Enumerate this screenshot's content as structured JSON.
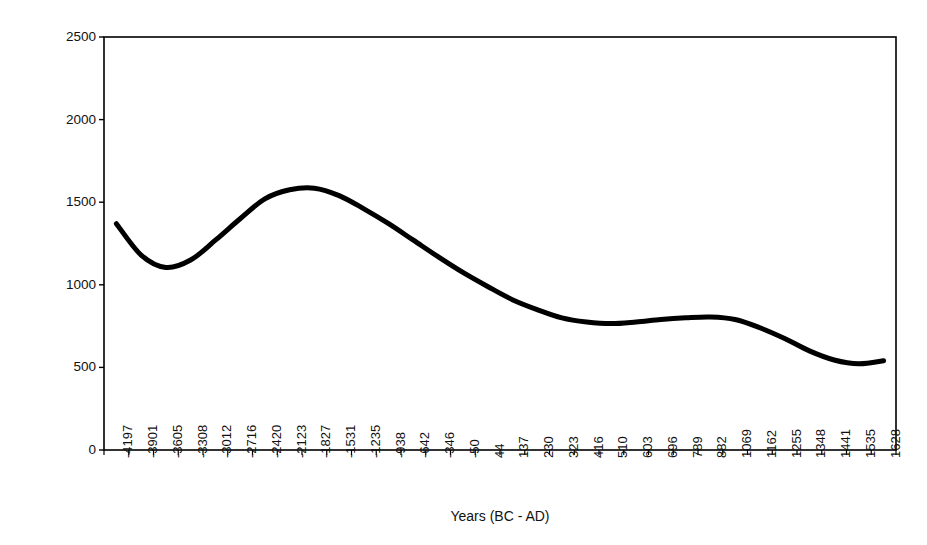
{
  "chart_data": {
    "type": "line",
    "title": "",
    "xlabel": "Years (BC - AD)",
    "ylabel": "Arboreal Pollen Count",
    "ylim": [
      0,
      2500
    ],
    "yticks": [
      0,
      500,
      1000,
      1500,
      2000,
      2500
    ],
    "grid": false,
    "legend": null,
    "line_color": "#000000",
    "line_width": 5,
    "categories": [
      "-4197",
      "-3901",
      "-3605",
      "-3308",
      "-3012",
      "-2716",
      "-2420",
      "-2123",
      "-1827",
      "-1531",
      "-1235",
      "-938",
      "-642",
      "-346",
      "-50",
      "44",
      "137",
      "230",
      "323",
      "416",
      "510",
      "603",
      "696",
      "789",
      "882",
      "1069",
      "1162",
      "1255",
      "1348",
      "1441",
      "1535",
      "1628"
    ],
    "values": [
      1370,
      1180,
      1105,
      1150,
      1270,
      1400,
      1520,
      1575,
      1585,
      1540,
      1460,
      1370,
      1270,
      1170,
      1075,
      990,
      910,
      850,
      800,
      775,
      765,
      775,
      790,
      800,
      805,
      790,
      740,
      675,
      600,
      545,
      522,
      540
    ],
    "xlim_labels": {
      "first": "-4197",
      "last": "1628"
    },
    "annotations": []
  },
  "axes": {
    "frame_color": "#000000",
    "tick_color": "#000000"
  }
}
